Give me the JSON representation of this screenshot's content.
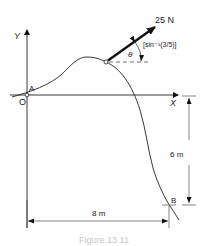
{
  "diagram": {
    "axes": {
      "x_label": "X",
      "y_label": "Y",
      "origin_label": "O"
    },
    "points": {
      "start": "A",
      "end": "B"
    },
    "force": {
      "magnitude_label": "25 N",
      "angle_symbol": "θ",
      "angle_value": "[sin⁻¹(3/5)]"
    },
    "dimensions": {
      "vertical": "6 m",
      "horizontal": "8 m"
    },
    "caption": "Figure 13.11"
  }
}
